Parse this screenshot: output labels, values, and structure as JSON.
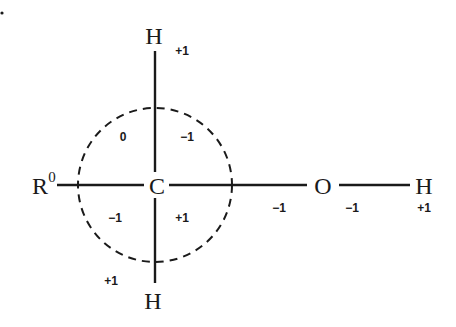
{
  "diagram": {
    "type": "oxidation-state-diagram",
    "molecule": "R-CH2-OH",
    "atoms": {
      "r_group": {
        "symbol": "R",
        "superscript": "0"
      },
      "carbon": {
        "symbol": "C"
      },
      "h_top": {
        "symbol": "H",
        "label": "+1"
      },
      "h_bottom": {
        "symbol": "H",
        "label": "+1"
      },
      "oxygen": {
        "symbol": "O",
        "label": "-1"
      },
      "h_right": {
        "symbol": "H",
        "label": "+1"
      }
    },
    "circle_quadrant_labels": {
      "upper_left": "0",
      "upper_right": "−1",
      "lower_left": "−1",
      "lower_right": "+1"
    },
    "bond_labels": {
      "c_o_bond": "−1",
      "oxygen_below": "−1",
      "h_right_below": "+1",
      "h_top_right": "+1",
      "h_bottom_left": "+1"
    },
    "colors": {
      "ink": "#1a1a1a",
      "background": "#ffffff"
    }
  }
}
